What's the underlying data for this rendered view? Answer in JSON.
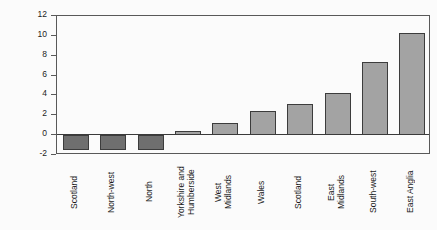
{
  "chart_data": {
    "type": "bar",
    "title": "",
    "xlabel": "",
    "ylabel": "Percentage change",
    "ylim": [
      -2,
      12
    ],
    "yticks": [
      -2,
      0,
      2,
      4,
      6,
      8,
      10,
      12
    ],
    "ytick_labels": [
      "-2",
      "0",
      "2",
      "4",
      "6",
      "8",
      "10",
      "12"
    ],
    "grid": false,
    "legend": null,
    "categories": [
      "Scotland",
      "North-west",
      "North",
      "Yorkshire and\nHumberside",
      "West\nMidlands",
      "Wales",
      "Scotland",
      "East\nMidlands",
      "South-west",
      "East Anglia"
    ],
    "values": [
      -1.5,
      -1.5,
      -1.5,
      0.4,
      1.2,
      2.4,
      3.1,
      4.2,
      7.4,
      10.3
    ],
    "colors": {
      "positive_fill": "#a3a3a3",
      "negative_fill": "#6f6f6f",
      "bar_border": "#3c3c3c",
      "axis": "#595959",
      "text": "#1c1c1c",
      "background": "#fbfbfb"
    }
  }
}
